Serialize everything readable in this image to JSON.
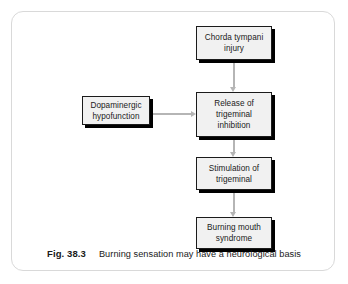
{
  "figure": {
    "caption_label": "Fig. 38.3",
    "caption_text": "Burning sensation may have a neurological basis",
    "border_color": "#d9d9d9",
    "background": "#ffffff"
  },
  "diagram": {
    "type": "flowchart",
    "node_fill": "#f1f1f1",
    "node_border": "#1b1b1b",
    "shadow_color": "#000000",
    "connector_color": "#b5b5b5",
    "nodes": [
      {
        "id": "chorda",
        "label": "Chorda tympani\ninjury"
      },
      {
        "id": "release",
        "label": "Release of\ntrigeminal\ninhibition"
      },
      {
        "id": "dopaminergic",
        "label": "Dopaminergic\nhypofunction"
      },
      {
        "id": "stimulation",
        "label": "Stimulation of\ntrigeminal"
      },
      {
        "id": "burning",
        "label": "Burning mouth\nsyndrome"
      }
    ],
    "edges": [
      {
        "from": "chorda",
        "to": "release",
        "direction": "down"
      },
      {
        "from": "release",
        "to": "stimulation",
        "direction": "down"
      },
      {
        "from": "stimulation",
        "to": "burning",
        "direction": "down"
      },
      {
        "from": "dopaminergic",
        "to": "release",
        "direction": "right"
      }
    ]
  }
}
